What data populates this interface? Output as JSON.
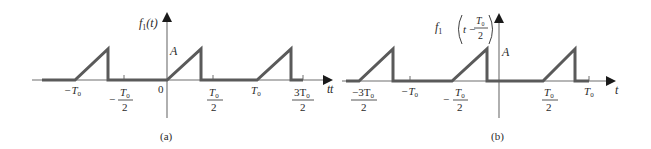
{
  "figure": {
    "panel_a": {
      "caption": "(a)",
      "y_label_main": "f",
      "y_label_sub": "1",
      "y_label_arg": "(t)",
      "x_label": "t",
      "amplitude_label": "A",
      "origin_label": "0",
      "ticks": {
        "neg_T0": "−T",
        "neg_half_T0_num": "T",
        "neg_half_T0_den": "2",
        "neg_sign": "−",
        "half_T0_num": "T",
        "half_T0_den": "2",
        "T0": "T",
        "three_half_num": "3T",
        "three_half_den": "2",
        "sub0": "0"
      }
    },
    "panel_b": {
      "caption": "(b)",
      "y_label_main": "f",
      "y_label_sub": "1",
      "y_label_arg_t": "t −",
      "y_label_frac_num": "T",
      "y_label_frac_den": "2",
      "x_label": "t",
      "amplitude_label": "A",
      "ticks": {
        "neg_three_half_num": "−3T",
        "neg_three_half_den": "2",
        "neg_T0": "−T",
        "neg_half_num": "T",
        "neg_half_den": "2",
        "neg_sign": "−",
        "half_num": "T",
        "half_den": "2",
        "T0": "T",
        "sub0": "0"
      }
    },
    "colors": {
      "signal": "#5a5a5a",
      "axis": "#6e6e6e",
      "text": "#2a2a2a"
    }
  }
}
